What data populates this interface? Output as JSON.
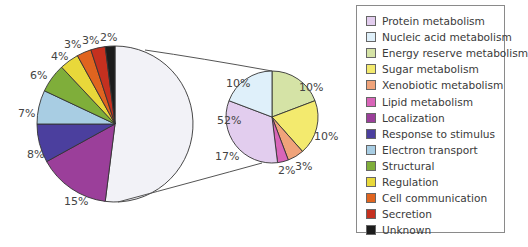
{
  "chart_data": [
    {
      "type": "pie",
      "title": "",
      "name": "main-pie",
      "categories": [
        "Metabolism (combined)",
        "Localization",
        "Response to stimulus",
        "Electron transport",
        "Structural",
        "Regulation",
        "Cell communication",
        "Secretion",
        "Unknown"
      ],
      "values": [
        52,
        15,
        8,
        7,
        6,
        4,
        3,
        3,
        2
      ],
      "labels": [
        "52%",
        "15%",
        "8%",
        "7%",
        "6%",
        "4%",
        "3%",
        "3%",
        "2%"
      ],
      "colors": [
        "#f2f2f7",
        "#9b3f9a",
        "#4b3f9e",
        "#a8cde3",
        "#7fae3a",
        "#e8d83a",
        "#e0641f",
        "#c5301f",
        "#1c1c1c"
      ],
      "start_angle_deg": 0,
      "direction": "clockwise"
    },
    {
      "type": "pie",
      "title": "",
      "name": "metabolism-breakdown-pie",
      "categories": [
        "Energy reserve metabolism",
        "Sugar metabolism",
        "Xenobiotic metabolism",
        "Lipid metabolism",
        "Protein metabolism",
        "Nucleic acid metabolism"
      ],
      "values": [
        10,
        10,
        3,
        2,
        17,
        10
      ],
      "labels": [
        "10%",
        "10%",
        "3%",
        "2%",
        "17%",
        "10%"
      ],
      "colors": [
        "#d5e3a6",
        "#f3ea6e",
        "#f0a37a",
        "#d865b8",
        "#e2cdee",
        "#dff0fa"
      ],
      "start_angle_deg": 0,
      "direction": "clockwise"
    }
  ],
  "legend": {
    "position": "right",
    "items": [
      {
        "label": "Protein metabolism",
        "color": "#e2cdee"
      },
      {
        "label": "Nucleic acid metabolism",
        "color": "#dff0fa"
      },
      {
        "label": "Energy reserve metabolism",
        "color": "#d5e3a6"
      },
      {
        "label": "Sugar metabolism",
        "color": "#f3ea6e"
      },
      {
        "label": "Xenobiotic metabolism",
        "color": "#f0a37a"
      },
      {
        "label": "Lipid metabolism",
        "color": "#d865b8"
      },
      {
        "label": "Localization",
        "color": "#9b3f9a"
      },
      {
        "label": "Response to stimulus",
        "color": "#4b3f9e"
      },
      {
        "label": "Electron transport",
        "color": "#a8cde3"
      },
      {
        "label": "Structural",
        "color": "#7fae3a"
      },
      {
        "label": "Regulation",
        "color": "#e8d83a"
      },
      {
        "label": "Cell communication",
        "color": "#e0641f"
      },
      {
        "label": "Secretion",
        "color": "#c5301f"
      },
      {
        "label": "Unknown",
        "color": "#1c1c1c"
      }
    ]
  },
  "label_positions": {
    "main": [
      {
        "text": "52%",
        "x": 217,
        "y": 124
      },
      {
        "text": "15%",
        "x": 64,
        "y": 205
      },
      {
        "text": "8%",
        "x": 27,
        "y": 158
      },
      {
        "text": "7%",
        "x": 18,
        "y": 117
      },
      {
        "text": "6%",
        "x": 30,
        "y": 79
      },
      {
        "text": "4%",
        "x": 51,
        "y": 60
      },
      {
        "text": "3%",
        "x": 64,
        "y": 48
      },
      {
        "text": "3%",
        "x": 82,
        "y": 44
      },
      {
        "text": "2%",
        "x": 100,
        "y": 41
      }
    ],
    "breakdown": [
      {
        "text": "10%",
        "x": 299,
        "y": 91
      },
      {
        "text": "10%",
        "x": 314,
        "y": 140
      },
      {
        "text": "3%",
        "x": 295,
        "y": 170
      },
      {
        "text": "2%",
        "x": 278,
        "y": 174
      },
      {
        "text": "17%",
        "x": 215,
        "y": 160
      },
      {
        "text": "10%",
        "x": 226,
        "y": 87
      }
    ]
  }
}
